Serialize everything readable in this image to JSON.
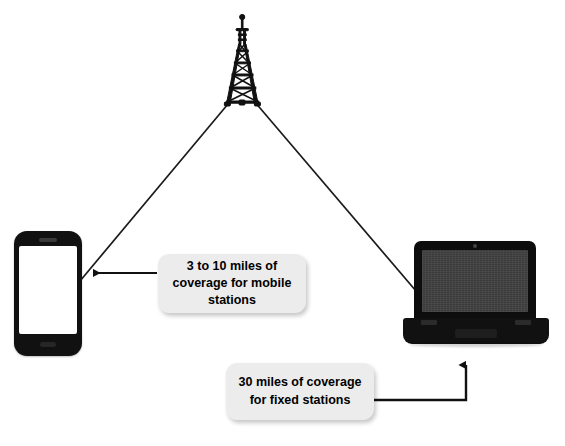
{
  "diagram": {
    "background_color": "#ffffff",
    "nodes": {
      "tower": {
        "name": "base-station-tower",
        "label": "",
        "color": "#111111"
      },
      "mobile_station": {
        "name": "mobile-phone",
        "label": "",
        "color": "#111111",
        "screen_color": "#ffffff"
      },
      "fixed_station": {
        "name": "laptop-computer",
        "label": "",
        "color": "#0d0d0d",
        "screen_color": "#3b3b3b"
      }
    },
    "callouts": [
      {
        "id": "mobile",
        "text": "3 to 10 miles of coverage for mobile stations",
        "line1": "3 to 10 miles of",
        "line2": "coverage for mobile",
        "line3": "stations",
        "fill": "#ececec",
        "text_color": "#000000",
        "points_to": "mobile-phone"
      },
      {
        "id": "fixed",
        "text": "30 miles of coverage for fixed stations",
        "line1": "30 miles of",
        "line2": "coverage for fixed",
        "line3": "stations",
        "fill": "#ececec",
        "text_color": "#000000",
        "points_to": "laptop-computer"
      }
    ],
    "links": [
      {
        "name": "tower-to-mobile-link",
        "from": "base-station-tower",
        "to": "mobile-phone",
        "color": "#1a1a1a"
      },
      {
        "name": "tower-to-fixed-link",
        "from": "base-station-tower",
        "to": "laptop-computer",
        "color": "#1a1a1a"
      }
    ],
    "connectors": [
      {
        "name": "mobile-callout-arrow",
        "direction": "left",
        "color": "#111111"
      },
      {
        "name": "fixed-callout-arrow",
        "direction": "up",
        "color": "#111111"
      }
    ]
  }
}
